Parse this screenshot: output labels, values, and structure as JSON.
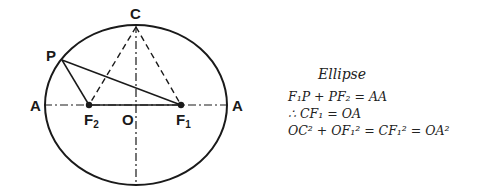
{
  "diagram": {
    "title": "Ellipse",
    "labels": {
      "C": "C",
      "P": "P",
      "A_left": "A",
      "A_right": "A",
      "O": "O",
      "F2": "F",
      "F2_sub": "2",
      "F1": "F",
      "F1_sub": "1"
    },
    "equations": {
      "line1": "F₁P + PF₂ = AA",
      "line2": "∴ CF₁ = OA",
      "line3": "OC² + OF₁² = CF₁² = OA²"
    },
    "stroke_color": "#1a1a1a"
  }
}
